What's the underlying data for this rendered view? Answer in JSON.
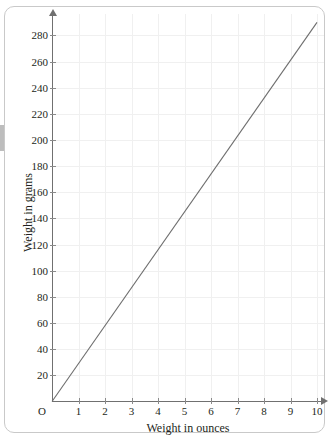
{
  "chart_data": {
    "type": "line",
    "title": "",
    "xlabel": "Weight in ounces",
    "ylabel": "Weight in grams",
    "origin_label": "O",
    "xlim": [
      0,
      10.4
    ],
    "ylim": [
      0,
      296
    ],
    "xticks": [
      1,
      2,
      3,
      4,
      5,
      6,
      7,
      8,
      9,
      10
    ],
    "xticklabels": [
      "1",
      "2",
      "3",
      "4",
      "5",
      "6",
      "7",
      "8",
      "9",
      "10"
    ],
    "yticks": [
      20,
      40,
      60,
      80,
      100,
      120,
      140,
      160,
      180,
      200,
      220,
      240,
      260,
      280
    ],
    "yticklabels": [
      "20",
      "40",
      "60",
      "80",
      "100",
      "120",
      "140",
      "160",
      "180",
      "200",
      "220",
      "240",
      "260",
      "280"
    ],
    "grid": true,
    "grid_color": "#f0f0f0",
    "legend": null,
    "series": [
      {
        "name": "ounces to grams",
        "color": "#6e6e6e",
        "x": [
          0,
          10
        ],
        "values": [
          0,
          290
        ],
        "slope_grams_per_ounce": 29,
        "points": [
          {
            "x": 0,
            "y": 0
          },
          {
            "x": 1,
            "y": 29
          },
          {
            "x": 2,
            "y": 58
          },
          {
            "x": 3,
            "y": 87
          },
          {
            "x": 4,
            "y": 116
          },
          {
            "x": 5,
            "y": 145
          },
          {
            "x": 6,
            "y": 174
          },
          {
            "x": 7,
            "y": 203
          },
          {
            "x": 8,
            "y": 232
          },
          {
            "x": 9,
            "y": 261
          },
          {
            "x": 10,
            "y": 290
          }
        ]
      }
    ],
    "axis_color": "#707070",
    "text_color": "#231f20"
  }
}
